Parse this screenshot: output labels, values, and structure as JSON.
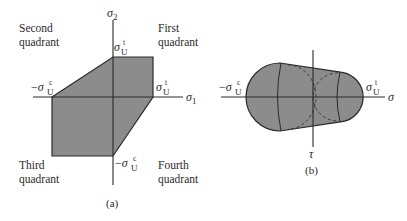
{
  "figure_a": {
    "caption": "(a)",
    "axis_x_label": "σ",
    "axis_x_sub": "1",
    "axis_y_label": "σ",
    "axis_y_sub": "2",
    "quadrants": {
      "first": [
        "First",
        "quadrant"
      ],
      "second": [
        "Second",
        "quadrant"
      ],
      "third": [
        "Third",
        "quadrant"
      ],
      "fourth": [
        "Fourth",
        "quadrant"
      ]
    },
    "labels": {
      "neg_sign": "−",
      "sigma": "σ",
      "sub_U": "U",
      "sup_t": "t",
      "sup_c": "c"
    },
    "fill_color": "#8c8c8c",
    "stroke_color": "#2a2a2a"
  },
  "figure_b": {
    "caption": "(b)",
    "axis_x_label": "σ",
    "axis_y_label": "τ",
    "labels": {
      "neg_sign": "−",
      "sigma": "σ",
      "sub_U": "U",
      "sup_t": "t",
      "sup_c": "c"
    },
    "fill_color": "#8c8c8c",
    "stroke_color": "#2a2a2a"
  }
}
